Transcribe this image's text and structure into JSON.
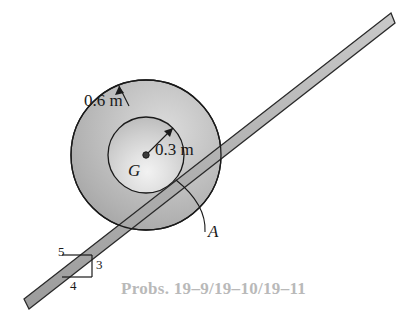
{
  "figure": {
    "caption": "Probs. 19–9/19–10/19–11",
    "labels": {
      "outer_radius": "0.6 m",
      "inner_radius": "0.3 m",
      "center": "G",
      "contact_point": "A"
    },
    "slope_triangle": {
      "hypotenuse": "5",
      "vertical": "3",
      "horizontal": "4"
    },
    "colors": {
      "outline": "#1a1a1a",
      "outer_disk_fill": "#b3b3b3",
      "inner_disk_fill": "#d8d8d8",
      "bar_fill": "#b0b0b0",
      "caption_gray": "#b9b9b9",
      "background": "#ffffff"
    },
    "geometry": {
      "center_x": 146,
      "center_y": 155,
      "outer_radius_px": 75,
      "inner_radius_px": 38,
      "incline_slope_ratio": "3:4",
      "incline_angle_deg": 36.87
    }
  }
}
